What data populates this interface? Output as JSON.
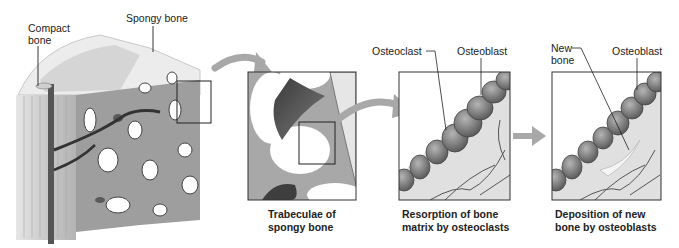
{
  "figure": {
    "overview": {
      "labels": {
        "compact_bone": [
          "Compact",
          "bone"
        ],
        "spongy_bone": "Spongy bone"
      }
    },
    "panels": [
      {
        "id": "trabeculae",
        "caption": [
          "Trabeculae of",
          "spongy bone"
        ],
        "labels": []
      },
      {
        "id": "resorption",
        "caption": [
          "Resorption of bone",
          "matrix by osteoclasts"
        ],
        "labels": [
          "Osteoclast",
          "Osteoblast"
        ]
      },
      {
        "id": "deposition",
        "caption": [
          "Deposition of new",
          "bone by osteoblasts"
        ],
        "labels": [
          "New",
          "bone",
          "Osteoblast"
        ]
      }
    ],
    "colors": {
      "arrow": "#9a9a9a",
      "frame": "#333333",
      "bone_light": "#d8d8d8",
      "bone_dark": "#4a4a4a"
    }
  }
}
